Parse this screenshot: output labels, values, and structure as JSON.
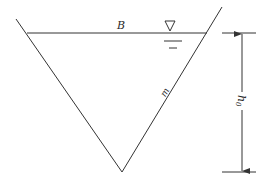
{
  "diagram": {
    "labels": {
      "top_width": "B",
      "side_slope": "m",
      "depth": "h",
      "depth_subscript": "0"
    },
    "symbols": {
      "water_level": "water-level-triangle-icon"
    },
    "geometry": {
      "left_bank_top": [
        16,
        19
      ],
      "left_water_point": [
        27,
        33
      ],
      "vertex": [
        122,
        172
      ],
      "right_water_point": [
        207,
        33
      ],
      "right_bank_top": [
        222,
        7
      ],
      "dimension_x": 242,
      "dimension_top_y": 33,
      "dimension_bottom_y": 172
    },
    "colors": {
      "line": "#333333",
      "background": "#ffffff"
    }
  }
}
